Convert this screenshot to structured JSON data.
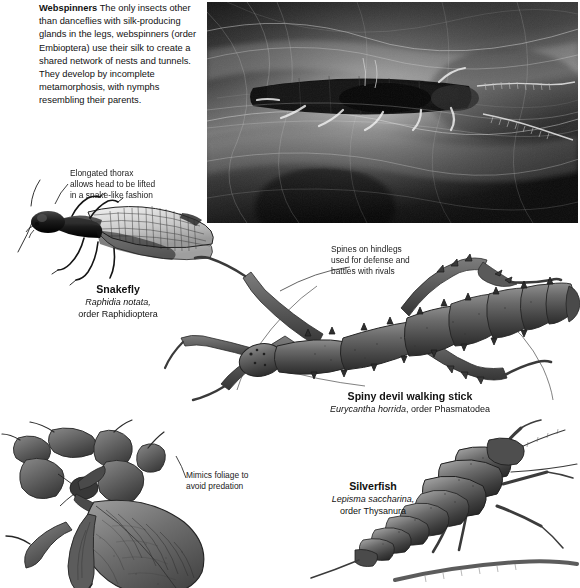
{
  "page": {
    "background": "#ffffff",
    "width": 580,
    "height": 585
  },
  "intro": {
    "heading": "Webspinners",
    "body": " The only insects other than danceflies with silk-producing glands in the legs, webspinners (order Embioptera) use their silk to create a shared network of nests and tunnels. They develop by incomplete metamorphosis, with nymphs resembling their parents."
  },
  "photo": {
    "name": "webspinner-photograph",
    "alt": "Black and white macro photograph of a webspinner insect resting inside a dense network of silk webbing",
    "style": "grayscale"
  },
  "annotations": [
    {
      "id": "thorax",
      "lines": [
        "Elongated thorax",
        "allows head to be lifted",
        "in a snake-like fashion"
      ],
      "text": "Elongated thorax allows head to be lifted in a snake-like fashion"
    },
    {
      "id": "spines",
      "lines": [
        "Spines on hindlegs",
        "used for defense and",
        "battles with rivals"
      ],
      "text": "Spines on hindlegs used for defense and battles with rivals"
    },
    {
      "id": "mimics",
      "lines": [
        "Mimics foliage to",
        "avoid predation"
      ],
      "text": "Mimics foliage to avoid predation"
    }
  ],
  "captions": {
    "snakefly": {
      "common_name": "Snakefly",
      "species": "Raphidia notata,",
      "order": "order Raphidioptera"
    },
    "walking_stick": {
      "common_name": "Spiny devil walking stick",
      "species": "Eurycantha horrida",
      "order": ", order Phasmatodea"
    },
    "silverfish": {
      "common_name": "Silverfish",
      "species": "Lepisma saccharina,",
      "order": "order Thysanura"
    }
  },
  "illustrations": [
    {
      "id": "snakefly",
      "name": "snakefly-illustration",
      "description": "Side view engraving of a snakefly with long neck-like thorax, raised head, two pairs of veined transparent wings and long antennae"
    },
    {
      "id": "walking-stick",
      "name": "spiny-devil-walking-stick-illustration",
      "description": "Top view engraving of a spiny devil walking stick with segmented ringed abdomen and spined hind legs"
    },
    {
      "id": "leaf-insect",
      "name": "leaf-insect-illustration",
      "description": "Engraving of a leaf insect whose flattened body and limb lobes mimic foliage"
    },
    {
      "id": "silverfish",
      "name": "silverfish-illustration",
      "description": "Engraving of a silverfish with scaled tapering body, long antennae and three tail filaments"
    }
  ],
  "colors": {
    "text": "#1a1a1a",
    "ink": "#2b2b2b",
    "paper": "#ffffff",
    "photo_dark": "#101010",
    "photo_light": "#d9d9d9"
  }
}
